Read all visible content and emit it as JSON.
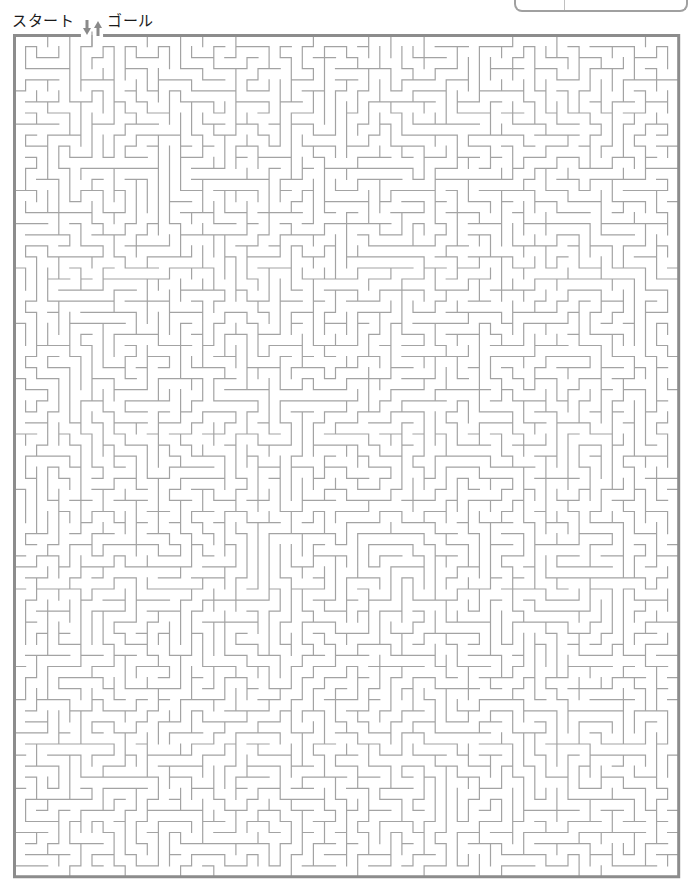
{
  "header": {
    "start_label": "スタート",
    "goal_label": "ゴール",
    "start_arrow_icon": "arrow-down-icon",
    "goal_arrow_icon": "arrow-up-icon"
  },
  "maze": {
    "cols": 60,
    "rows": 76,
    "origin_x": 14.5,
    "origin_y": 35.5,
    "cell_w": 11.07,
    "cell_h": 11.07,
    "entrance_col": 6,
    "exit_col": 7,
    "seed": 20240517,
    "wall_color": "#a3a3a3",
    "border_color": "#8c8c8c",
    "wall_width": 1.2,
    "border_width": 3
  },
  "colors": {
    "arrow": "#8a8a8a",
    "text": "#1a1a1a",
    "background": "#ffffff"
  }
}
